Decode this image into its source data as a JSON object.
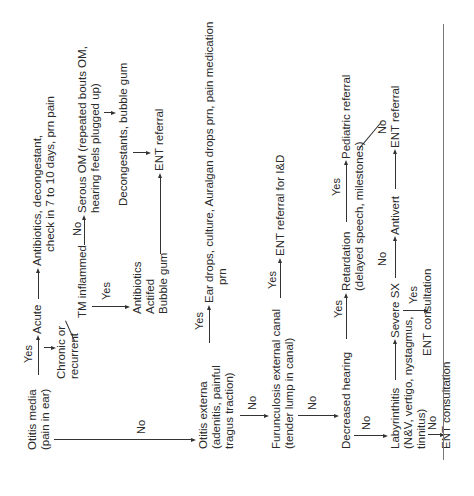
{
  "diagram": {
    "type": "flowchart",
    "orientation": "rotated-90-ccw",
    "nodes": {
      "otitis_media": [
        "Otitis media",
        "(pain in ear)"
      ],
      "acute": "Acute",
      "acute_tx": [
        "Antibiotics, decongestant,",
        "check in 7 to 10 days, prn pain"
      ],
      "chronic": [
        "Chronic or",
        "recurrent"
      ],
      "tm_inflamed": "TM inflammed",
      "serous_om": [
        "Serous  OM  (repeated  bouts  OM,",
        "hearing feels plugged up)"
      ],
      "decongestants": "Decongestants, bubble gum",
      "ent_referral_1": "ENT referral",
      "tm_yes_tx": [
        "Antibiotics",
        "Actifed",
        "Bubble gum"
      ],
      "otitis_externa": [
        "Otitis externa",
        "(adenitis, painful",
        "tragus traction)"
      ],
      "externa_tx": [
        "Ear drops, culture, Auralgan drops prn, pain medication",
        "prn"
      ],
      "furunculosis": [
        "Furunculosis external canal",
        "(tender lump in canal)"
      ],
      "ent_referral_id": "ENT referral for I&D",
      "decreased_hearing": "Decreased hearing",
      "retardation": [
        "Retardation",
        "(delayed speech, milestones)"
      ],
      "pediatric_referral": "Pediatric referral",
      "labyrinthitis": [
        "Labyrinthitis",
        "(N&V, vertigo, nystagmus,",
        "tinnitus)"
      ],
      "severe_sx": "Severe SX",
      "antivert": "Antivert",
      "ent_referral_2": "ENT referral",
      "ent_consultation_1": "ENT consultation",
      "ent_consultation_2": "ENT consultation"
    },
    "edge_labels": {
      "yes": "Yes",
      "no": "No"
    },
    "edges": [
      {
        "from": "Otitis media",
        "to": "Acute",
        "label": "Yes"
      },
      {
        "from": "Acute",
        "to": "Antibiotics, decongestant, check in 7 to 10 days, prn pain",
        "label": ""
      },
      {
        "from": "Acute",
        "to": "Chronic or recurrent",
        "label": ""
      },
      {
        "from": "Chronic or recurrent",
        "to": "TM inflammed",
        "label": ""
      },
      {
        "from": "TM inflammed",
        "to": "Serous OM",
        "label": "No"
      },
      {
        "from": "TM inflammed",
        "to": "Antibiotics, Actifed, Bubble gum",
        "label": "Yes"
      },
      {
        "from": "Serous OM",
        "to": "Decongestants, bubble gum",
        "label": ""
      },
      {
        "from": "Decongestants, bubble gum",
        "to": "ENT referral",
        "label": ""
      },
      {
        "from": "Antibiotics, Actifed, Bubble gum",
        "to": "ENT referral",
        "label": ""
      },
      {
        "from": "Otitis media",
        "to": "Otitis externa",
        "label": "No"
      },
      {
        "from": "Otitis externa",
        "to": "Ear drops, culture, Auralgan drops prn, pain medication prn",
        "label": "Yes"
      },
      {
        "from": "Otitis externa",
        "to": "Furunculosis external canal",
        "label": "No"
      },
      {
        "from": "Furunculosis external canal",
        "to": "ENT referral for I&D",
        "label": "Yes"
      },
      {
        "from": "Furunculosis external canal",
        "to": "Decreased hearing",
        "label": "No"
      },
      {
        "from": "Decreased hearing",
        "to": "Retardation",
        "label": "Yes"
      },
      {
        "from": "Retardation",
        "to": "Pediatric referral",
        "label": "Yes"
      },
      {
        "from": "Retardation",
        "to": "ENT referral",
        "label": "No"
      },
      {
        "from": "Decreased hearing",
        "to": "Labyrinthitis",
        "label": "No"
      },
      {
        "from": "Labyrinthitis",
        "to": "Severe SX",
        "label": ""
      },
      {
        "from": "Severe SX",
        "to": "Antivert",
        "label": "No"
      },
      {
        "from": "Antivert",
        "to": "ENT referral",
        "label": ""
      },
      {
        "from": "Severe SX",
        "to": "ENT consultation",
        "label": "Yes"
      },
      {
        "from": "Labyrinthitis",
        "to": "ENT consultation",
        "label": "No"
      }
    ]
  }
}
